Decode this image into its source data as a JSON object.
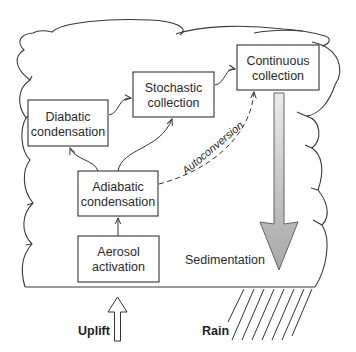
{
  "diagram": {
    "type": "cloud microphysics process schematic",
    "boxes": [
      {
        "id": "diabatic",
        "line1": "Diabatic",
        "line2": "condensation"
      },
      {
        "id": "stochastic",
        "line1": "Stochastic",
        "line2": "collection"
      },
      {
        "id": "continuous",
        "line1": "Continuous",
        "line2": "collection"
      },
      {
        "id": "adiabatic",
        "line1": "Adiabatic",
        "line2": "condensation"
      },
      {
        "id": "aerosol",
        "line1": "Aerosol",
        "line2": "activation"
      }
    ],
    "labels": {
      "autoconversion": "Autoconversion",
      "sedimentation": "Sedimentation",
      "uplift": "Uplift",
      "rain": "Rain"
    },
    "connections": [
      {
        "from": "Aerosol activation",
        "to": "Adiabatic condensation",
        "style": "solid"
      },
      {
        "from": "Adiabatic condensation",
        "to": "Diabatic condensation",
        "style": "solid"
      },
      {
        "from": "Adiabatic condensation",
        "to": "Stochastic collection",
        "style": "solid"
      },
      {
        "from": "Diabatic condensation",
        "to": "Stochastic collection",
        "style": "solid"
      },
      {
        "from": "Stochastic collection",
        "to": "Continuous collection",
        "style": "solid"
      },
      {
        "from": "Adiabatic condensation",
        "to": "Continuous collection",
        "style": "dashed",
        "label": "Autoconversion"
      }
    ],
    "colors": {
      "line": "#333333",
      "sedimentation_arrow_fill": "#b8b8b8",
      "sedimentation_arrow_light": "#e2e2e2",
      "background": "#ffffff"
    }
  }
}
